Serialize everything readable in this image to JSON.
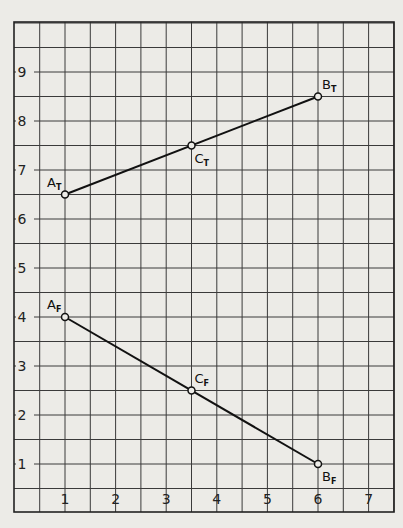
{
  "chart_data": {
    "type": "line",
    "title": "",
    "xlabel": "",
    "ylabel": "",
    "xlim": [
      0,
      7.5
    ],
    "ylim": [
      0,
      10
    ],
    "grid": true,
    "grid_minor_step": 0.5,
    "x_ticks": [
      "1",
      "2",
      "3",
      "4",
      "5",
      "6",
      "7"
    ],
    "y_ticks": [
      "1",
      "2",
      "3",
      "4",
      "5",
      "6",
      "7",
      "8",
      "9"
    ],
    "series": [
      {
        "name": "Top view line A_T B_T",
        "points": [
          {
            "label": "A",
            "sub": "T",
            "x": 1,
            "y": 6.5
          },
          {
            "label": "C",
            "sub": "T",
            "x": 3.5,
            "y": 7.5
          },
          {
            "label": "B",
            "sub": "T",
            "x": 6,
            "y": 8.5
          }
        ]
      },
      {
        "name": "Front view line A_F B_F",
        "points": [
          {
            "label": "A",
            "sub": "F",
            "x": 1,
            "y": 4
          },
          {
            "label": "C",
            "sub": "F",
            "x": 3.5,
            "y": 2.5
          },
          {
            "label": "B",
            "sub": "F",
            "x": 6,
            "y": 1
          }
        ]
      }
    ]
  },
  "colors": {
    "paper": "#ecebe7",
    "grid": "#3a3a3a",
    "ink": "#111111"
  }
}
